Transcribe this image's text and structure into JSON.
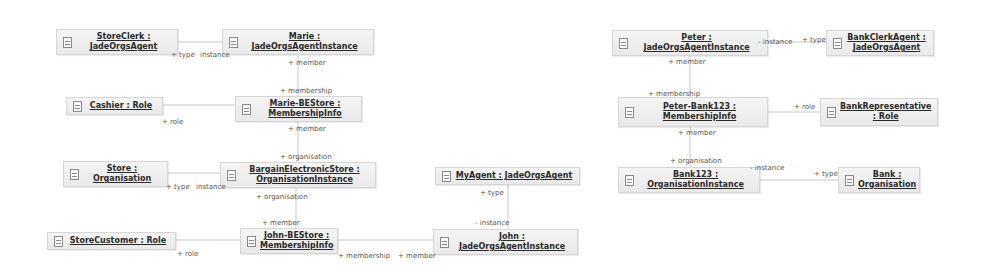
{
  "diagram": {
    "nodes": [
      {
        "id": "storeclerk",
        "line1": "StoreClerk :",
        "line2": "JadeOrgsAgent"
      },
      {
        "id": "marie",
        "line1": "Marie :",
        "line2": "JadeOrgsAgentInstance"
      },
      {
        "id": "cashier",
        "line1": "Cashier : Role",
        "line2": ""
      },
      {
        "id": "marie-bestore",
        "line1": "Marie-BEStore :",
        "line2": "MembershipInfo"
      },
      {
        "id": "store",
        "line1": "Store :",
        "line2": "Organisation"
      },
      {
        "id": "bargain",
        "line1": "BargainElectronicStore :",
        "line2": "OrganisationInstance"
      },
      {
        "id": "myagent",
        "line1": "MyAgent : JadeOrgsAgent",
        "line2": ""
      },
      {
        "id": "storecustomer",
        "line1": "StoreCustomer : Role",
        "line2": ""
      },
      {
        "id": "john-bestore",
        "line1": "John-BEStore :",
        "line2": "MembershipInfo"
      },
      {
        "id": "john",
        "line1": "John :",
        "line2": "JadeOrgsAgentInstance"
      },
      {
        "id": "peter",
        "line1": "Peter :",
        "line2": "JadeOrgsAgentInstance"
      },
      {
        "id": "bankclerk",
        "line1": "BankClerkAgent :",
        "line2": "JadeOrgsAgent"
      },
      {
        "id": "peter-bank123",
        "line1": "Peter-Bank123 :",
        "line2": "MembershipInfo"
      },
      {
        "id": "bankrep",
        "line1": "BankRepresentative",
        "line2": ": Role"
      },
      {
        "id": "bank123",
        "line1": "Bank123 :",
        "line2": "OrganisationInstance"
      },
      {
        "id": "bank",
        "line1": "Bank :",
        "line2": "Organisation"
      }
    ],
    "edge_labels": {
      "storeclerk_type": "+ type",
      "marie_instance": "instance",
      "marie_member": "+ member",
      "mariebe_membership": "+ membership",
      "cashier_role": "+ role",
      "mariebe_member": "+ member",
      "bargain_organisation_top": "+ organisation",
      "store_type": "+ type",
      "bargain_instance": "instance",
      "bargain_organisation_bottom": "+ organisation",
      "johnbe_member": "+ member",
      "storecustomer_role": "+ role",
      "johnbe_membership": "+ membership",
      "john_member": "+ member",
      "myagent_type": "+ type",
      "john_instance": "- instance",
      "peter_instance": "- instance",
      "bankclerk_type": "+ type",
      "peter_member": "+ member",
      "peterbank_membership": "+ membership",
      "bankrep_role": "+ role",
      "peterbank_member": "+ member",
      "bank123_organisation": "+ organisation",
      "bank123_instance": "- instance",
      "bank_type": "+ type"
    }
  }
}
